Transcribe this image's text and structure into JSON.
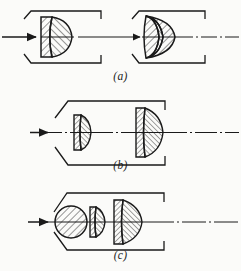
{
  "figure": {
    "background_color": "#fbfbf9",
    "ink_color": "#1a1a1a",
    "axis_style": "dash-dot centerline",
    "hatch_style": "diagonal section hatching"
  },
  "captions": {
    "a": "(a)",
    "b": "(b)",
    "c": "(c)"
  },
  "panels": [
    {
      "id": "a",
      "caption": "(a)",
      "housing_count": 2,
      "groups": [
        {
          "name": "front-doublet",
          "elements": 2,
          "description": "cemented doublet, flat left face, convex right face"
        },
        {
          "name": "rear-triplet",
          "elements": 3,
          "description": "thick biconvex triplet with two cemented interfaces"
        }
      ]
    },
    {
      "id": "b",
      "caption": "(b)",
      "housing_count": 1,
      "groups": [
        {
          "name": "small-doublet",
          "elements": 2,
          "description": "small plano-convex doublet, flat left face"
        },
        {
          "name": "large-doublet",
          "elements": 2,
          "description": "large plano-convex doublet, flat left face"
        }
      ]
    },
    {
      "id": "c",
      "caption": "(c)",
      "housing_count": 1,
      "groups": [
        {
          "name": "ball-lens",
          "elements": 1,
          "description": "spherical ball lens"
        },
        {
          "name": "small-meniscus",
          "elements": 2,
          "description": "small meniscus doublet"
        },
        {
          "name": "large-convex",
          "elements": 2,
          "description": "large convex doublet, flat left face"
        }
      ]
    }
  ]
}
